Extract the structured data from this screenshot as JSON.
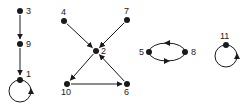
{
  "diagram": {
    "type": "directed-graph",
    "colors": {
      "ink": "#1a1a1a",
      "background": "#ffffff"
    },
    "nodes": [
      {
        "id": "3",
        "label": "3",
        "x": 20,
        "y": 11,
        "label_dx": 6,
        "label_dy": 3
      },
      {
        "id": "9",
        "label": "9",
        "x": 20,
        "y": 44,
        "label_dx": 6,
        "label_dy": 3
      },
      {
        "id": "1",
        "label": "1",
        "x": 20,
        "y": 80,
        "label_dx": 6,
        "label_dy": -3
      },
      {
        "id": "4",
        "label": "4",
        "x": 64,
        "y": 21,
        "label_dx": -3,
        "label_dy": -6
      },
      {
        "id": "7",
        "label": "7",
        "x": 127,
        "y": 20,
        "label_dx": -3,
        "label_dy": -6
      },
      {
        "id": "2",
        "label": "2",
        "x": 96,
        "y": 51,
        "label_dx": 5,
        "label_dy": 3
      },
      {
        "id": "10",
        "label": "10",
        "x": 67,
        "y": 84,
        "label_dx": -6,
        "label_dy": 11
      },
      {
        "id": "6",
        "label": "6",
        "x": 127,
        "y": 84,
        "label_dx": -3,
        "label_dy": 11
      },
      {
        "id": "5",
        "label": "5",
        "x": 149,
        "y": 52,
        "label_dx": -10,
        "label_dy": 3
      },
      {
        "id": "8",
        "label": "8",
        "x": 185,
        "y": 52,
        "label_dx": 6,
        "label_dy": 3
      },
      {
        "id": "11",
        "label": "11",
        "x": 226,
        "y": 45,
        "label_dx": -6,
        "label_dy": -6
      }
    ],
    "edges": [
      {
        "from": "3",
        "to": "9",
        "kind": "straight"
      },
      {
        "from": "9",
        "to": "1",
        "kind": "straight"
      },
      {
        "from": "1",
        "to": "1",
        "kind": "loop",
        "cx": 20,
        "cy": 91,
        "r": 11
      },
      {
        "from": "4",
        "to": "2",
        "kind": "straight"
      },
      {
        "from": "7",
        "to": "2",
        "kind": "straight"
      },
      {
        "from": "2",
        "to": "10",
        "kind": "straight"
      },
      {
        "from": "10",
        "to": "6",
        "kind": "straight"
      },
      {
        "from": "6",
        "to": "2",
        "kind": "straight"
      },
      {
        "from": "8",
        "to": "5",
        "kind": "arc-upper"
      },
      {
        "from": "5",
        "to": "8",
        "kind": "arc-lower"
      },
      {
        "from": "11",
        "to": "11",
        "kind": "loop",
        "cx": 226,
        "cy": 56,
        "r": 11
      }
    ]
  }
}
